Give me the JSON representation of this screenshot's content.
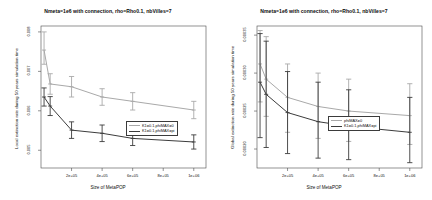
{
  "figure": {
    "xlabel": "Size of MetaPOP",
    "panels": [
      {
        "name": "local-extinction-panel",
        "title": "Nmeta=1e6  with connection, rho=Rho0.1, nbVilles=7",
        "ylabel": "Local extinction rate during 50 years simulation time",
        "legend": [
          {
            "label": "K1=0.1,phiMAX=0",
            "color": "#a9a9a9"
          },
          {
            "label": "K1=0.1,phiMAX=pi",
            "color": "#3c3c3c"
          }
        ]
      },
      {
        "name": "global-extinction-panel",
        "title": "Nmeta=1e6  with connection, rho=Rho0.1, nbVilles=7",
        "ylabel": "Global extinction rate during 50 years simulation time",
        "legend": [
          {
            "label": "phiMAX=0",
            "color": "#a9a9a9"
          },
          {
            "label": "K1=0.1,phiMAX=pi",
            "color": "#3c3c3c"
          }
        ]
      }
    ]
  },
  "chart_data": [
    {
      "type": "line",
      "name": "local-extinction",
      "title": "Nmeta=1e6  with connection, rho=Rho0.1, nbVilles=7",
      "xlabel": "Size of MetaPOP",
      "ylabel": "Local extinction rate during 50 years simulation time",
      "grid": false,
      "legend_position": "center-right",
      "xlim": [
        0,
        1080000
      ],
      "ylim": [
        0.00455,
        0.00815
      ],
      "xticks": [
        200000,
        400000,
        600000,
        800000,
        1000000
      ],
      "xtick_labels": [
        "2e+05",
        "4e+05",
        "6e+05",
        "8e+05",
        "1e+06"
      ],
      "yticks": [
        0.005,
        0.006,
        0.007,
        0.008
      ],
      "ytick_labels": [
        "0.005",
        "0.006",
        "0.007",
        "0.008"
      ],
      "x": [
        20000,
        60000,
        200000,
        400000,
        600000,
        1000000
      ],
      "series": [
        {
          "name": "K1=0.1,phiMAX=0",
          "color": "#a9a9a9",
          "values": [
            0.00754,
            0.00668,
            0.00661,
            0.00635,
            0.00624,
            0.00602
          ],
          "err_low": [
            0.00718,
            0.00642,
            0.00635,
            0.00614,
            0.00602,
            0.0058
          ],
          "err_high": [
            0.008,
            0.00694,
            0.00687,
            0.00656,
            0.00646,
            0.00624
          ]
        },
        {
          "name": "K1=0.1,phiMAX=pi",
          "color": "#3c3c3c",
          "values": [
            0.00635,
            0.00612,
            0.00551,
            0.00543,
            0.0053,
            0.00521
          ],
          "err_low": [
            0.00612,
            0.00588,
            0.0053,
            0.00522,
            0.00512,
            0.00503
          ],
          "err_high": [
            0.00658,
            0.00636,
            0.00572,
            0.00564,
            0.00548,
            0.00539
          ]
        }
      ]
    },
    {
      "type": "line",
      "name": "global-extinction",
      "title": "Nmeta=1e6  with connection, rho=Rho0.1, nbVilles=7",
      "xlabel": "Size of MetaPOP",
      "ylabel": "Global extinction rate during 50 years simulation time",
      "grid": false,
      "legend_position": "center-right",
      "xlim": [
        0,
        1080000
      ],
      "ylim": [
        0.000175,
        0.000362
      ],
      "xticks": [
        200000,
        400000,
        600000,
        800000,
        1000000
      ],
      "xtick_labels": [
        "2e+05",
        "4e+05",
        "6e+05",
        "8e+05",
        "1e+06"
      ],
      "yticks": [
        0.0002,
        0.00025,
        0.0003,
        0.00035
      ],
      "ytick_labels": [
        "0.00020",
        "0.00025",
        "0.00030",
        "0.00035"
      ],
      "x": [
        20000,
        60000,
        200000,
        400000,
        600000,
        1000000
      ],
      "series": [
        {
          "name": "phiMAX=0",
          "color": "#a9a9a9",
          "values": [
            0.000312,
            0.000292,
            0.000268,
            0.000256,
            0.00025,
            0.000244
          ],
          "err_low": [
            0.000262,
            0.000243,
            0.000222,
            0.000214,
            0.00021,
            0.000206
          ],
          "err_high": [
            0.000356,
            0.000348,
            0.000312,
            0.0003,
            0.000292,
            0.000286
          ]
        },
        {
          "name": "K1=0.1,phiMAX=pi",
          "color": "#3c3c3c",
          "values": [
            0.000288,
            0.000272,
            0.000248,
            0.000236,
            0.00023,
            0.000222
          ],
          "err_low": [
            0.000215,
            0.000202,
            0.000194,
            0.000188,
            0.000186,
            0.000182
          ],
          "err_high": [
            0.000352,
            0.000342,
            0.000302,
            0.000288,
            0.000278,
            0.000268
          ]
        }
      ]
    }
  ]
}
